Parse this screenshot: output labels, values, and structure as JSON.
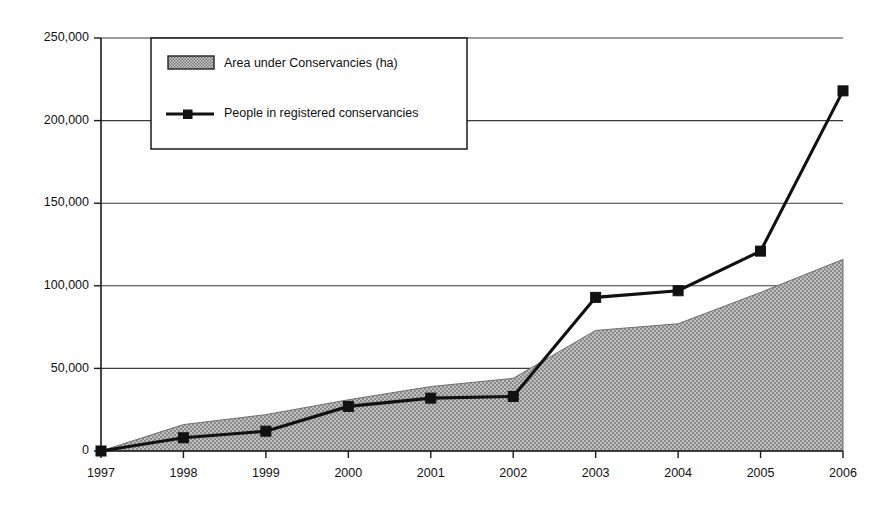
{
  "chart_data": {
    "type": "area",
    "title": "",
    "xlabel": "",
    "ylabel": "",
    "x": [
      1997,
      1998,
      1999,
      2000,
      2001,
      2002,
      2003,
      2004,
      2005,
      2006
    ],
    "categories": [
      "1997",
      "1998",
      "1999",
      "2000",
      "2001",
      "2002",
      "2003",
      "2004",
      "2005",
      "2006"
    ],
    "xtick_labels": [
      "1997",
      "1998",
      "1999",
      "2000",
      "2001",
      "2002",
      "2003",
      "2004",
      "2005",
      "2006"
    ],
    "ytick_labels": [
      "0",
      "50,000",
      "100,000",
      "150,000",
      "200,000",
      "250,000"
    ],
    "ytick_values": [
      0,
      50000,
      100000,
      150000,
      200000,
      250000
    ],
    "ylim": [
      0,
      250000
    ],
    "xlim": [
      1997,
      2006
    ],
    "grid": "horizontal",
    "legend_position": "top-left-inside",
    "series": [
      {
        "name": "Area under Conservancies (ha)",
        "type": "area",
        "marker": "none",
        "fill": "#a8a8a8",
        "values": [
          0,
          16000,
          22000,
          31000,
          39000,
          44000,
          73000,
          77000,
          96000,
          116000
        ]
      },
      {
        "name": "People in registered conservancies",
        "type": "line",
        "marker": "square",
        "color": "#111111",
        "values": [
          0,
          8000,
          12000,
          27000,
          32000,
          33000,
          93000,
          97000,
          121000,
          218000
        ]
      }
    ]
  },
  "legend": {
    "items": [
      {
        "label": "Area under Conservancies (ha)",
        "swatch": "hatched-rectangle"
      },
      {
        "label": "People in registered conservancies",
        "swatch": "line-with-square-marker"
      }
    ]
  },
  "colors": {
    "area_fill": "#a8a8a8",
    "line": "#111111",
    "axis": "#1a1a1a",
    "background": "#ffffff"
  }
}
